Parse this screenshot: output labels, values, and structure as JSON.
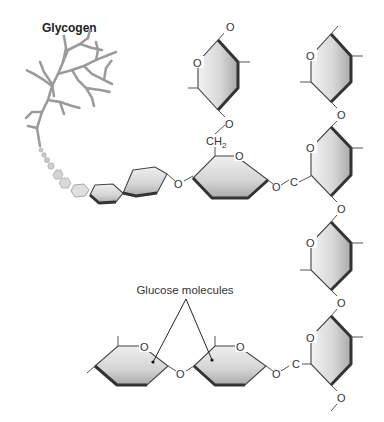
{
  "diagram": {
    "title": "Glycogen",
    "caption": "Glucose molecules",
    "atoms": {
      "oxygen": "O",
      "carbon": "C",
      "ch2": "CH",
      "ch2_subscript": "2"
    },
    "colors": {
      "ring_fill_light": "#ececec",
      "ring_fill_dark": "#b8b8b8",
      "ring_edge_dark": "#333333",
      "branch_gray": "#9a9a9a",
      "text": "#222222"
    },
    "structure": {
      "branch_ring_count": 6,
      "horizontal_chain_rings": 2,
      "vertical_chain_rings": 4,
      "linkages": [
        "alpha-1,4 glycosidic",
        "alpha-1,6 glycosidic (CH2 branch)"
      ]
    }
  }
}
